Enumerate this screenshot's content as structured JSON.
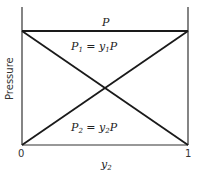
{
  "diagram": {
    "type": "pressure-composition diagram (Raoult's law, ideal binary mixture)",
    "y_axis_label": "Pressure",
    "x_axis_label": "y",
    "x_axis_label_sub": "2",
    "x_ticks": [
      "0",
      "1"
    ],
    "lines": {
      "total": {
        "label": "P"
      },
      "p1": {
        "label_main": "P",
        "label_sub": "1",
        "label_eq": " = y",
        "label_eq_sub": "1",
        "label_tail": "P"
      },
      "p2": {
        "label_main": "P",
        "label_sub": "2",
        "label_eq": " = y",
        "label_eq_sub": "2",
        "label_tail": "P"
      }
    },
    "colors": {
      "line": "#1a1a1a",
      "axis": "#333333"
    }
  }
}
